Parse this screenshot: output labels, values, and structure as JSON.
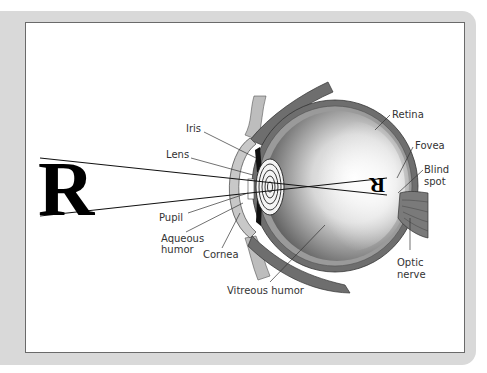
{
  "figure": {
    "object_letter": "R",
    "image_letter": "R",
    "labels": {
      "iris": "Iris",
      "lens": "Lens",
      "pupil": "Pupil",
      "aqueous_1": "Aqueous",
      "aqueous_2": "humor",
      "cornea": "Cornea",
      "vitreous": "Vitreous humor",
      "retina": "Retina",
      "fovea": "Fovea",
      "blind_1": "Blind",
      "blind_2": "spot",
      "optic_1": "Optic",
      "optic_2": "nerve"
    }
  },
  "colors": {
    "frame": "#d9d9d9",
    "panel": "#ffffff",
    "sclera": "#6e6e6e",
    "cornea": "#c8c8c8",
    "text": "#333333"
  }
}
